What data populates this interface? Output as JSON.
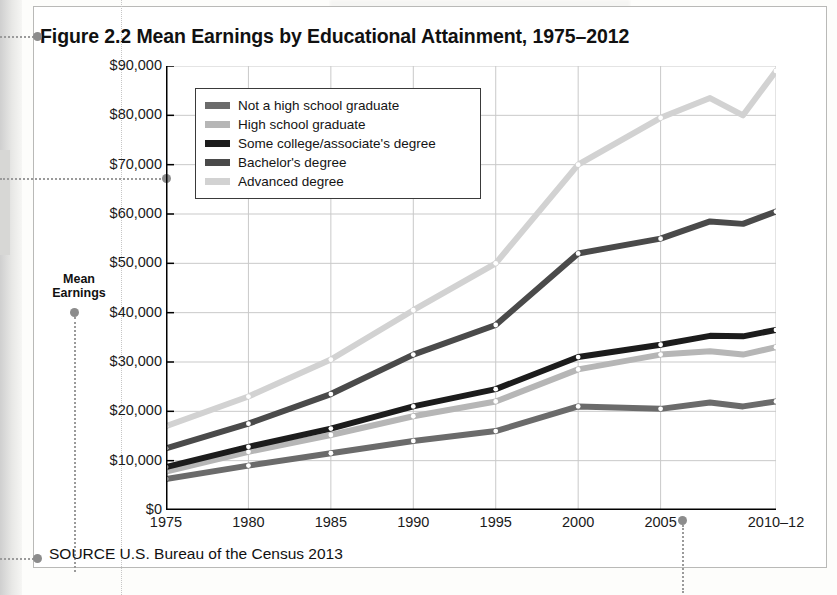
{
  "figure": {
    "title": "Figure 2.2  Mean Earnings by Educational Attainment, 1975–2012",
    "source": "SOURCE  U.S. Bureau of the Census 2013",
    "axis_label_line1": "Mean",
    "axis_label_line2": "Earnings"
  },
  "colors": {
    "not_hs": "#6b6b6b",
    "hs": "#b6b6b6",
    "some_college": "#1c1c1c",
    "bachelors": "#4a4a4a",
    "advanced": "#d2d2d2",
    "axis": "#000000",
    "grid": "#c9c9c9",
    "annotation_dot": "#8c8c8c",
    "frame": "#b9b9b7"
  },
  "chart_data": {
    "type": "line",
    "title": "Mean Earnings by Educational Attainment, 1975–2012",
    "xlabel": "",
    "ylabel": "Mean Earnings",
    "xlim": [
      1975,
      2012
    ],
    "ylim": [
      0,
      90000
    ],
    "yticks": [
      0,
      10000,
      20000,
      30000,
      40000,
      50000,
      60000,
      70000,
      80000,
      90000
    ],
    "ytick_labels": [
      "$0",
      "$10,000",
      "$20,000",
      "$30,000",
      "$40,000",
      "$50,000",
      "$60,000",
      "$70,000",
      "$80,000",
      "$90,000"
    ],
    "xticks": [
      1975,
      1980,
      1985,
      1990,
      1995,
      2000,
      2005,
      2012
    ],
    "xtick_labels": [
      "1975",
      "1980",
      "1985",
      "1990",
      "1995",
      "2000",
      "2005",
      "2010–12"
    ],
    "grid": true,
    "legend_position": "upper-left-inside",
    "x": [
      1975,
      1980,
      1985,
      1990,
      1995,
      2000,
      2005,
      2008,
      2010,
      2012
    ],
    "series": [
      {
        "name": "Not a high school graduate",
        "color": "#6b6b6b",
        "values": [
          6300,
          9000,
          11500,
          14000,
          16000,
          21000,
          20500,
          21800,
          21000,
          22000
        ]
      },
      {
        "name": "High school graduate",
        "color": "#b6b6b6",
        "values": [
          7800,
          11800,
          15200,
          19000,
          22000,
          28500,
          31500,
          32200,
          31500,
          33000
        ]
      },
      {
        "name": "Some college/associate's degree",
        "color": "#1c1c1c",
        "values": [
          8700,
          12800,
          16500,
          21000,
          24500,
          31000,
          33500,
          35300,
          35200,
          36500
        ]
      },
      {
        "name": "Bachelor's degree",
        "color": "#4a4a4a",
        "values": [
          12500,
          17500,
          23500,
          31500,
          37500,
          52000,
          55000,
          58500,
          58000,
          60500
        ]
      },
      {
        "name": "Advanced degree",
        "color": "#d2d2d2",
        "values": [
          17000,
          23000,
          30500,
          40500,
          50000,
          70000,
          79500,
          83500,
          80000,
          89000
        ]
      }
    ]
  },
  "legend": {
    "items": [
      {
        "label": "Not a high school graduate",
        "color": "#6b6b6b"
      },
      {
        "label": "High school graduate",
        "color": "#b6b6b6"
      },
      {
        "label": "Some college/associate's degree",
        "color": "#1c1c1c"
      },
      {
        "label": "Bachelor's degree",
        "color": "#4a4a4a"
      },
      {
        "label": "Advanced degree",
        "color": "#d2d2d2"
      }
    ]
  }
}
